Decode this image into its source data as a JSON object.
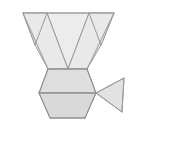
{
  "canvas": {
    "width": 186,
    "height": 152,
    "background": "#ffffff",
    "title": "Polyhedron net diagram"
  },
  "style": {
    "stroke": "#8f8f8f",
    "stroke_light": "#a8a8a8",
    "stroke_width": 1,
    "fill_pale": "#efefef",
    "fill_light": "#e8e8e8",
    "fill_mid": "#e0e0e0",
    "fill_dark": "#d6d6d6",
    "fill_darker": "#cfcfcf"
  },
  "shapes": [
    {
      "id": "top-left-triangle",
      "name": "top-left-triangle",
      "label": "Top left corner triangle",
      "points": "23,13 47,13 35,45",
      "fill": "#efefef",
      "stroke": "#9a9a9a"
    },
    {
      "id": "top-right-triangle",
      "name": "top-right-triangle",
      "label": "Top right corner triangle",
      "points": "89,13 114,13 101,45",
      "fill": "#efefef",
      "stroke": "#9a9a9a"
    },
    {
      "id": "central-inverted-triangle",
      "name": "central-inverted-triangle",
      "label": "Central inverted triangle face",
      "points": "47,13 89,13 68,69",
      "fill": "#ececec",
      "stroke": "#9a9a9a"
    },
    {
      "id": "left-trapezoid-wedge",
      "name": "left-trapezoid-wedge",
      "label": "Left wedge of inverted trapezoid",
      "points": "23,13 35,45 48,69 68,69 47,13",
      "fill": "#e9e9e9",
      "stroke": "#9a9a9a"
    },
    {
      "id": "right-trapezoid-wedge",
      "name": "right-trapezoid-wedge",
      "label": "Right wedge of inverted trapezoid",
      "points": "114,13 101,45 87,69 68,69 89,13",
      "fill": "#e9e9e9",
      "stroke": "#9a9a9a"
    },
    {
      "id": "hexagon-upper-half",
      "name": "hexagon-upper-half",
      "label": "Upper half of hexagon face",
      "points": "48,69 87,69 96,93 39,93",
      "fill": "#dedede",
      "stroke": "#8f8f8f"
    },
    {
      "id": "hexagon-lower-half",
      "name": "hexagon-lower-half",
      "label": "Lower half of hexagon face",
      "points": "39,93 96,93 85,118 50,118",
      "fill": "#d9d9d9",
      "stroke": "#8f8f8f"
    },
    {
      "id": "right-side-triangle",
      "name": "right-side-triangle",
      "label": "Right side triangle flap",
      "points": "96,93 124,78 122,112",
      "fill": "#e2e2e2",
      "stroke": "#9a9a9a"
    }
  ],
  "edges": [
    {
      "id": "top-edge",
      "name": "top-edge",
      "d": "M23,13 L114,13",
      "stroke": "#a0a0a0"
    },
    {
      "id": "edge-tri-left-inner",
      "name": "edge-top-left-triangle-inner",
      "d": "M47,13 L35,45",
      "stroke": "#9a9a9a"
    },
    {
      "id": "edge-tri-right-inner",
      "name": "edge-top-right-triangle-inner",
      "d": "M89,13 L101,45",
      "stroke": "#9a9a9a"
    },
    {
      "id": "edge-left-slant",
      "name": "edge-trapezoid-left-slant",
      "d": "M23,13 L48,69",
      "stroke": "#9a9a9a"
    },
    {
      "id": "edge-right-slant",
      "name": "edge-trapezoid-right-slant",
      "d": "M114,13 L87,69",
      "stroke": "#9a9a9a"
    },
    {
      "id": "edge-mid-horizontal",
      "name": "edge-trapezoid-hexagon-seam",
      "d": "M48,69 L87,69",
      "stroke": "#8f8f8f"
    },
    {
      "id": "edge-hex-left-upper",
      "name": "edge-hexagon-left-upper",
      "d": "M48,69 L39,93",
      "stroke": "#8f8f8f"
    },
    {
      "id": "edge-hex-right-upper",
      "name": "edge-hexagon-right-upper",
      "d": "M87,69 L96,93",
      "stroke": "#8f8f8f"
    },
    {
      "id": "edge-hex-waist",
      "name": "edge-hexagon-waist",
      "d": "M39,93 L96,93",
      "stroke": "#8f8f8f"
    },
    {
      "id": "edge-hex-left-lower",
      "name": "edge-hexagon-left-lower",
      "d": "M39,93 L50,118",
      "stroke": "#8f8f8f"
    },
    {
      "id": "edge-hex-right-lower",
      "name": "edge-hexagon-right-lower",
      "d": "M96,93 L85,118",
      "stroke": "#8f8f8f"
    },
    {
      "id": "edge-hex-bottom",
      "name": "edge-hexagon-bottom",
      "d": "M50,118 L85,118",
      "stroke": "#8f8f8f"
    },
    {
      "id": "edge-flap-upper",
      "name": "edge-right-flap-upper",
      "d": "M96,93 L124,78",
      "stroke": "#9a9a9a"
    },
    {
      "id": "edge-flap-right",
      "name": "edge-right-flap-vertical",
      "d": "M124,78 L122,112",
      "stroke": "#9a9a9a"
    },
    {
      "id": "edge-flap-lower",
      "name": "edge-right-flap-lower",
      "d": "M122,112 L96,93",
      "stroke": "#9a9a9a"
    }
  ]
}
